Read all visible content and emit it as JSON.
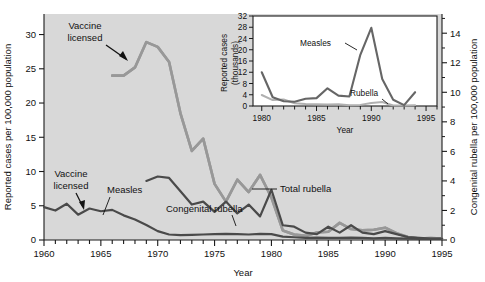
{
  "chart_data": [
    {
      "id": "main",
      "type": "line",
      "title": "",
      "xlabel": "Year",
      "ylabel": "Reported cases per 100,000 population",
      "ylabel_right": "Congenital rubella per 100,000 population",
      "xlim": [
        1960,
        1995
      ],
      "ylim": [
        0,
        33
      ],
      "ylim_right": [
        0,
        15.3
      ],
      "xticks_major": [
        1960,
        1965,
        1970,
        1975,
        1980,
        1985,
        1990,
        1995
      ],
      "xticks_minor_step": 1,
      "yticks_left": [
        0,
        5,
        10,
        15,
        20,
        25,
        30
      ],
      "yticks_right": [
        0,
        2,
        4,
        6,
        8,
        10,
        12,
        14
      ],
      "grid": false,
      "legend_position": "inline-annotations",
      "plot_bg": "#d8d8d8",
      "series": [
        {
          "name": "Measles",
          "color": "#989898",
          "axis": "left",
          "x": [
            1966,
            1967,
            1968,
            1969,
            1970,
            1971,
            1972,
            1973,
            1974,
            1975,
            1976,
            1977,
            1978,
            1979,
            1980,
            1981,
            1982,
            1983,
            1984,
            1985,
            1986,
            1987,
            1988,
            1989,
            1990,
            1991,
            1992,
            1993,
            1994,
            1995
          ],
          "values": [
            24.0,
            24.0,
            25.2,
            28.9,
            28.2,
            26.0,
            18.5,
            13.0,
            14.8,
            8.2,
            5.6,
            8.8,
            7.0,
            9.5,
            6.2,
            1.4,
            0.8,
            0.6,
            1.1,
            1.2,
            2.5,
            1.6,
            1.4,
            1.5,
            1.8,
            1.0,
            0.45,
            0.2,
            0.3,
            0.2
          ]
        },
        {
          "name": "Total rubella",
          "color": "#989898",
          "axis": "left",
          "x": [
            1966,
            1967,
            1968,
            1969,
            1970,
            1971,
            1972,
            1973,
            1974,
            1975,
            1976,
            1977,
            1978,
            1979,
            1980,
            1981,
            1982,
            1983,
            1984,
            1985,
            1986,
            1987,
            1988,
            1989,
            1990,
            1991,
            1992,
            1993,
            1994,
            1995
          ],
          "values": [
            24.0,
            24.0,
            25.2,
            28.9,
            28.2,
            26.0,
            18.5,
            13.0,
            14.8,
            8.2,
            5.6,
            8.8,
            7.0,
            9.5,
            6.2,
            1.4,
            0.8,
            0.6,
            1.1,
            1.2,
            2.5,
            1.6,
            1.4,
            1.5,
            1.8,
            1.0,
            0.45,
            0.2,
            0.3,
            0.2
          ]
        },
        {
          "name": "Congenital rubella",
          "color": "#4a4a4a",
          "axis": "right",
          "x": [
            1969,
            1970,
            1971,
            1972,
            1973,
            1974,
            1975,
            1976,
            1977,
            1978,
            1979,
            1980,
            1981,
            1982,
            1983,
            1984,
            1985,
            1986,
            1987,
            1988,
            1989,
            1990,
            1991,
            1992,
            1993,
            1994,
            1995
          ],
          "values": [
            4.0,
            4.3,
            4.2,
            3.3,
            2.4,
            2.6,
            1.9,
            2.6,
            1.8,
            2.4,
            1.6,
            3.4,
            1.0,
            0.9,
            0.5,
            0.4,
            0.9,
            0.5,
            1.0,
            0.5,
            0.4,
            0.6,
            0.4,
            0.2,
            0.15,
            0.1,
            0.1
          ]
        },
        {
          "name": "Measles (pre-vaccine, left scale)",
          "color": "#4a4a4a",
          "axis": "left",
          "x": [
            1960,
            1961,
            1962,
            1963,
            1964,
            1965,
            1966,
            1967,
            1968,
            1969,
            1970,
            1971,
            1972,
            1973,
            1974,
            1975,
            1976,
            1977,
            1978,
            1979,
            1980,
            1981,
            1982,
            1983,
            1984,
            1985,
            1986,
            1987,
            1988,
            1989,
            1990,
            1991,
            1992,
            1993,
            1994,
            1995
          ],
          "values": [
            4.8,
            4.3,
            5.3,
            3.7,
            4.6,
            4.2,
            4.4,
            3.6,
            3.0,
            2.2,
            1.3,
            0.8,
            0.7,
            0.75,
            0.8,
            0.85,
            0.9,
            0.85,
            0.8,
            0.9,
            0.85,
            0.5,
            0.4,
            0.3,
            0.35,
            0.3,
            0.3,
            0.35,
            0.3,
            0.25,
            0.3,
            0.25,
            0.2,
            0.15,
            0.15,
            0.15
          ]
        }
      ],
      "annotations": [
        {
          "text": "Vaccine licensed",
          "line1": "Vaccine",
          "line2": "licensed",
          "target_year": 1968.5,
          "note": "measles vaccine, upper arrow"
        },
        {
          "text": "Vaccine licensed",
          "line1": "Vaccine",
          "line2": "licensed",
          "target_year": 1963,
          "note": "rubella vaccine, lower arrow"
        },
        {
          "text": "Measles",
          "note": "leader to dark lower line"
        },
        {
          "text": "Congenital rubella",
          "note": "leader to dark mid line"
        },
        {
          "text": "Total rubella",
          "note": "leader to light gray line"
        }
      ]
    },
    {
      "id": "inset",
      "type": "line",
      "title": "",
      "xlabel": "Year",
      "ylabel": "Reported cases (thousands)",
      "xlim": [
        1979.2,
        1996
      ],
      "ylim": [
        0,
        32
      ],
      "xticks_major": [
        1980,
        1985,
        1990,
        1995
      ],
      "xticks_minor_step": 1,
      "yticks": [
        0,
        4,
        8,
        12,
        16,
        20,
        24,
        28,
        32
      ],
      "grid": false,
      "plot_bg": "#ffffff",
      "series": [
        {
          "name": "Measles",
          "color": "#666666",
          "x": [
            1980,
            1981,
            1982,
            1983,
            1984,
            1985,
            1986,
            1987,
            1988,
            1989,
            1990,
            1991,
            1992,
            1993,
            1994
          ],
          "values": [
            12.0,
            3.1,
            1.7,
            1.5,
            2.6,
            2.8,
            6.3,
            3.7,
            3.4,
            18.2,
            27.8,
            9.6,
            2.2,
            0.3,
            4.9
          ]
        },
        {
          "name": "Rubella",
          "color": "#b0b0b0",
          "x": [
            1980,
            1981,
            1982,
            1983,
            1984,
            1985,
            1986,
            1987,
            1988,
            1989,
            1990,
            1991,
            1992,
            1993,
            1994
          ],
          "values": [
            3.9,
            2.1,
            2.3,
            1.0,
            0.75,
            0.63,
            0.55,
            0.62,
            0.23,
            0.4,
            1.1,
            1.4,
            0.16,
            0.19,
            0.23
          ]
        }
      ],
      "annotations": [
        {
          "text": "Measles",
          "note": "leader to dark peak line"
        },
        {
          "text": "Rubella",
          "note": "leader to light line"
        }
      ]
    }
  ],
  "main": {
    "ylabel_left": "Reported cases per 100,000 population",
    "ylabel_right": "Congenital rubella per 100,000 population",
    "xlabel": "Year",
    "yticks_left": [
      "0",
      "5",
      "10",
      "15",
      "20",
      "25",
      "30"
    ],
    "yticks_right": [
      "0",
      "2",
      "4",
      "6",
      "8",
      "10",
      "12",
      "14"
    ],
    "xticks": [
      "1960",
      "1965",
      "1970",
      "1975",
      "1980",
      "1985",
      "1990",
      "1995"
    ],
    "ann_vaccine_top_l1": "Vaccine",
    "ann_vaccine_top_l2": "licensed",
    "ann_vaccine_bot_l1": "Vaccine",
    "ann_vaccine_bot_l2": "licensed",
    "ann_measles": "Measles",
    "ann_congenital": "Congenital rubella",
    "ann_total": "Total rubella"
  },
  "inset": {
    "ylabel_l1": "Reported cases",
    "ylabel_l2": "(thousands)",
    "xlabel": "Year",
    "yticks": [
      "0",
      "4",
      "8",
      "12",
      "16",
      "20",
      "24",
      "28",
      "32"
    ],
    "xticks": [
      "1980",
      "1985",
      "1990",
      "1995"
    ],
    "ann_measles": "Measles",
    "ann_rubella": "Rubella"
  },
  "colors": {
    "plot_background": "#d8d8d8",
    "light_line": "#989898",
    "dark_line": "#4a4a4a",
    "inset_background": "#ffffff",
    "inset_measles": "#666666",
    "inset_rubella": "#b0b0b0",
    "axis": "#1a1a1a",
    "text": "#111111"
  }
}
